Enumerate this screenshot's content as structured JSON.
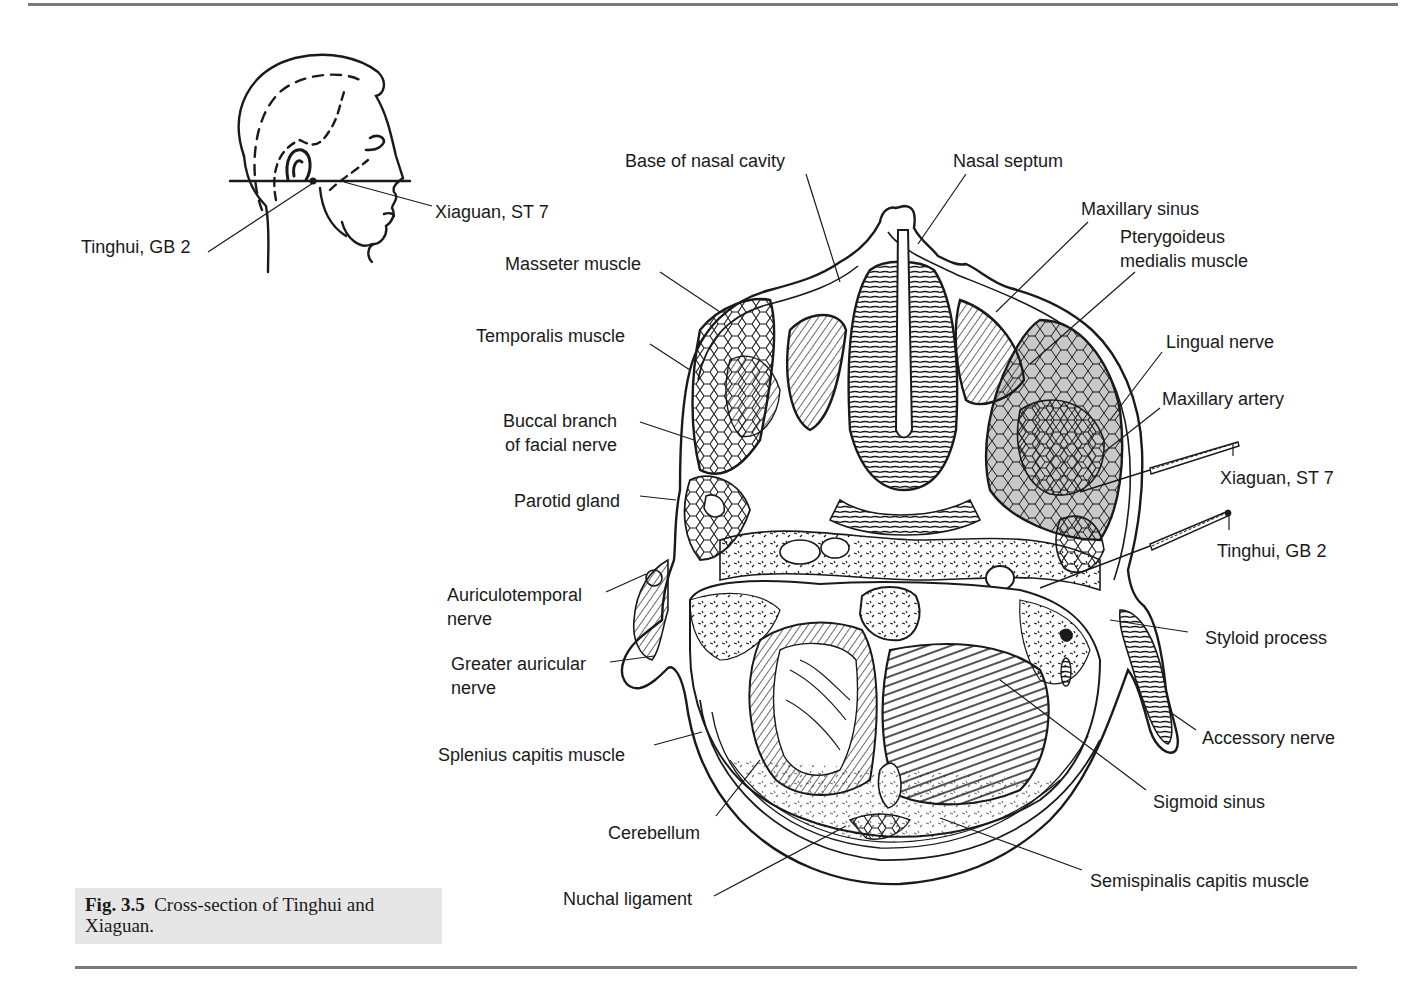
{
  "figure": {
    "number_label": "Fig. 3.5",
    "caption": "Cross-section of Tinghui and Xiaguan."
  },
  "inset": {
    "labels": {
      "tinghui": "Tinghui, GB 2",
      "xiaguan": "Xiaguan, ST 7"
    }
  },
  "cross_section": {
    "left_labels": [
      {
        "id": "masseter",
        "text": "Masseter muscle"
      },
      {
        "id": "temporalis",
        "text": "Temporalis muscle"
      },
      {
        "id": "buccal1",
        "text": "Buccal branch"
      },
      {
        "id": "buccal2",
        "text": "of facial nerve"
      },
      {
        "id": "parotid",
        "text": "Parotid gland"
      },
      {
        "id": "auriculo1",
        "text": "Auriculotemporal"
      },
      {
        "id": "auriculo2",
        "text": "nerve"
      },
      {
        "id": "greater1",
        "text": "Greater auricular"
      },
      {
        "id": "greater2",
        "text": "nerve"
      },
      {
        "id": "splenius",
        "text": "Splenius capitis muscle"
      },
      {
        "id": "cerebellum",
        "text": "Cerebellum"
      },
      {
        "id": "nuchal",
        "text": "Nuchal ligament"
      }
    ],
    "top_labels": [
      {
        "id": "base_nasal",
        "text": "Base of nasal cavity"
      },
      {
        "id": "nasal_septum",
        "text": "Nasal septum"
      }
    ],
    "right_labels": [
      {
        "id": "maxillary_sinus",
        "text": "Maxillary sinus"
      },
      {
        "id": "pterygoideus1",
        "text": "Pterygoideus"
      },
      {
        "id": "pterygoideus2",
        "text": "medialis muscle"
      },
      {
        "id": "lingual",
        "text": "Lingual nerve"
      },
      {
        "id": "maxillary_artery",
        "text": "Maxillary artery"
      },
      {
        "id": "xiaguan",
        "text": "Xiaguan, ST 7"
      },
      {
        "id": "tinghui",
        "text": "Tinghui, GB 2"
      },
      {
        "id": "styloid",
        "text": "Styloid process"
      },
      {
        "id": "accessory",
        "text": "Accessory nerve"
      },
      {
        "id": "sigmoid",
        "text": "Sigmoid sinus"
      },
      {
        "id": "semispinalis",
        "text": "Semispinalis capitis muscle"
      }
    ]
  },
  "colors": {
    "ink": "#1a1a1a",
    "caption_bg": "#e6e6e6",
    "rule": "#7a7a7a",
    "shaded_tissue": "#c8c8c8"
  }
}
